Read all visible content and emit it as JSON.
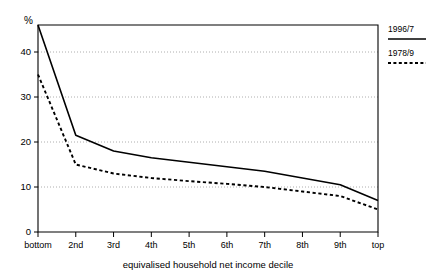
{
  "chart_data": {
    "type": "line",
    "title": "",
    "xlabel": "equivalised household net income decile",
    "ylabel": "%",
    "categories": [
      "bottom",
      "2nd",
      "3rd",
      "4th",
      "5th",
      "6th",
      "7th",
      "8th",
      "9th",
      "top"
    ],
    "ylim": [
      0,
      46
    ],
    "xlim": [
      0,
      9
    ],
    "yticks": [
      0,
      10,
      20,
      30,
      40
    ],
    "ytick_labels": [
      "0",
      "10",
      "20",
      "30",
      "40"
    ],
    "grid": "horizontal-dotted",
    "legend_position": "right-outside-top",
    "series": [
      {
        "name": "1996/7",
        "style": "solid",
        "values": [
          46.0,
          21.5,
          18.0,
          16.5,
          15.5,
          14.5,
          13.5,
          12.0,
          10.5,
          7.0
        ]
      },
      {
        "name": "1978/9",
        "style": "dotted",
        "values": [
          35.0,
          15.0,
          13.0,
          12.0,
          11.3,
          10.7,
          10.0,
          9.0,
          8.0,
          5.0
        ]
      }
    ]
  },
  "axis": {
    "y_unit_label": "%",
    "x_title": "equivalised household net income decile"
  },
  "legend": {
    "entries": [
      {
        "label": "1996/7",
        "style": "solid"
      },
      {
        "label": "1978/9",
        "style": "dotted"
      }
    ]
  }
}
